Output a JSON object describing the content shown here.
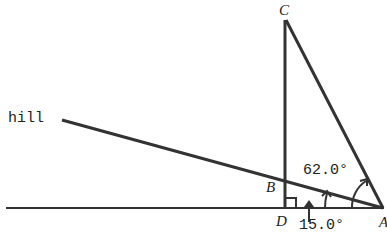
{
  "diagram": {
    "points": {
      "A": {
        "label": "A"
      },
      "B": {
        "label": "B"
      },
      "C": {
        "label": "C"
      },
      "D": {
        "label": "D"
      }
    },
    "labels": {
      "hill": "hill",
      "angle_hill": "15.0°",
      "angle_CAD": "62.0°"
    },
    "colors": {
      "line": "#222222",
      "background": "#ffffff"
    }
  }
}
